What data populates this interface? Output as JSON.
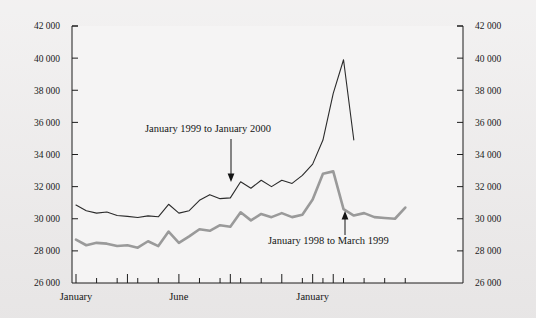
{
  "chart_data": {
    "type": "line",
    "title": "",
    "xlabel": "",
    "ylabel": "",
    "ylim": [
      26000,
      42000
    ],
    "y_ticks": [
      26000,
      28000,
      30000,
      32000,
      34000,
      36000,
      38000,
      40000,
      42000
    ],
    "y_tick_labels": [
      "26 000",
      "28 000",
      "30 000",
      "32 000",
      "34 000",
      "36 000",
      "38 000",
      "40 000",
      "42 000"
    ],
    "y_axis_left_labels": [
      "42 000",
      "40 000",
      "38 000",
      "36 000",
      "34 000",
      "32 000",
      "30 000",
      "28 000",
      "26 000"
    ],
    "y_axis_right_labels": [
      "42 000",
      "40 000",
      "38 000",
      "36 000",
      "34 000",
      "32 000",
      "30 000",
      "28 000",
      "26 000"
    ],
    "x_tick_labels": [
      "January",
      "June",
      "January"
    ],
    "x_tick_label_positions": [
      0,
      10,
      23
    ],
    "x_major_ticks": [
      0,
      5,
      10,
      15,
      20,
      23,
      25
    ],
    "x_points_count": 27,
    "grid": false,
    "legend": "none",
    "series": [
      {
        "name": "January 1999 to January 2000",
        "color": "#2b2b2b",
        "width": 1.1,
        "values": [
          30850,
          30500,
          30350,
          30420,
          30200,
          30150,
          30080,
          30180,
          30120,
          30900,
          30350,
          30500,
          31150,
          31500,
          31250,
          31300,
          32300,
          31900,
          32400,
          32000,
          32400,
          32200,
          32700,
          33400,
          34900,
          37800,
          39900,
          34900
        ]
      },
      {
        "name": "January 1998 to March 1999",
        "color": "#9a9a9a",
        "width": 2.6,
        "values": [
          28700,
          28350,
          28500,
          28450,
          28300,
          28350,
          28200,
          28600,
          28300,
          29200,
          28500,
          28900,
          29350,
          29250,
          29600,
          29500,
          30400,
          29900,
          30300,
          30100,
          30350,
          30100,
          30250,
          31200,
          32800,
          32950,
          30600,
          30200,
          30350,
          30100,
          30050,
          30000,
          30700
        ]
      }
    ],
    "annotations": [
      {
        "text": "January 1999 to January 2000",
        "target_series": "January 1999 to January 2000",
        "target_value": 32300,
        "arrow_direction": "down"
      },
      {
        "text": "January 1998 to March 1999",
        "target_series": "January 1998 to March 1999",
        "target_value": 30250,
        "arrow_direction": "up"
      }
    ]
  },
  "axes": {
    "left_tick_labels": [
      "42 000",
      "40 000",
      "38 000",
      "36 000",
      "34 000",
      "32 000",
      "30 000",
      "28 000",
      "26 000"
    ],
    "right_tick_labels": [
      "42 000",
      "40 000",
      "38 000",
      "36 000",
      "34 000",
      "32 000",
      "30 000",
      "28 000",
      "26 000"
    ],
    "bottom_tick_labels": [
      "January",
      "June",
      "January"
    ]
  },
  "colors": {
    "background": "#eceaea",
    "plot_background": "#f5f4f4",
    "axis": "#1d1d1d",
    "series_black": "#2b2b2b",
    "series_gray": "#9a9a9a",
    "text": "#141414"
  }
}
